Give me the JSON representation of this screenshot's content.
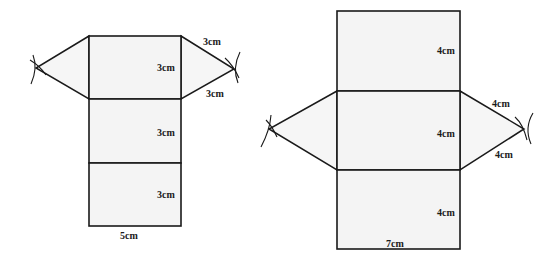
{
  "nets": [
    {
      "name": "triangular-prism-net-small",
      "labels": {
        "face1_height": "3cm",
        "face2_height": "3cm",
        "face3_height": "3cm",
        "base_width": "5cm",
        "triangle_side_upper": "3cm",
        "triangle_side_lower": "3cm"
      }
    },
    {
      "name": "triangular-prism-net-large",
      "labels": {
        "face1_height": "4cm",
        "face2_height": "4cm",
        "face3_height": "4cm",
        "base_width": "7cm",
        "triangle_side_upper": "4cm",
        "triangle_side_lower": "4cm"
      }
    }
  ]
}
